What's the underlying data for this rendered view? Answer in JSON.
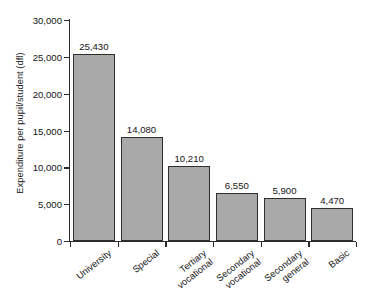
{
  "chart_data": {
    "type": "bar",
    "title": "",
    "xlabel": "",
    "ylabel": "Expenditure per pupil/student (dfl)",
    "categories": [
      "University",
      "Special",
      "Tertiary\nvocational",
      "Secondary\nvocational",
      "Secondary\ngeneral",
      "Basic"
    ],
    "values": [
      25430,
      14080,
      10210,
      6550,
      5900,
      4470
    ],
    "value_labels": [
      "25,430",
      "14,080",
      "10,210",
      "6,550",
      "5,900",
      "4,470"
    ],
    "ylim": [
      0,
      30000
    ],
    "ytick_values": [
      0,
      5000,
      10000,
      15000,
      20000,
      25000,
      30000
    ],
    "ytick_labels": [
      "0",
      "5,000",
      "10,000",
      "15,000",
      "20,000",
      "25,000",
      "30,000"
    ],
    "grid": false,
    "legend": null,
    "colors": {
      "bar_fill": "#a9a9a9",
      "bar_edge": "#2e2e2e",
      "axis": "#2b2b2b",
      "text": "#141414",
      "background": "#ffffff"
    }
  }
}
